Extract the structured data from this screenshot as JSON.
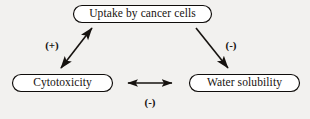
{
  "diagram": {
    "background_color": "#f2f1ef",
    "node_fill": "#ffffff",
    "stroke_color": "#16120f",
    "nodes": [
      {
        "id": "uptake",
        "label": "Uptake by cancer cells",
        "shape": "stadium"
      },
      {
        "id": "cytotoxicity",
        "label": "Cytotoxicity",
        "shape": "stadium"
      },
      {
        "id": "solubility",
        "label": "Water solubility",
        "shape": "stadium"
      }
    ],
    "edges": [
      {
        "id": "cytotoxicity-uptake",
        "from": "cytotoxicity",
        "to": "uptake",
        "label": "(+)",
        "sign": "positive",
        "arrowheads": "both",
        "orientation": "diagonal-left"
      },
      {
        "id": "uptake-solubility",
        "from": "uptake",
        "to": "solubility",
        "label": "(-)",
        "sign": "negative",
        "arrowheads": "end",
        "orientation": "diagonal-right"
      },
      {
        "id": "cytotoxicity-solubility",
        "from": "cytotoxicity",
        "to": "solubility",
        "label": "(-)",
        "sign": "negative",
        "arrowheads": "both",
        "orientation": "horizontal"
      }
    ]
  }
}
